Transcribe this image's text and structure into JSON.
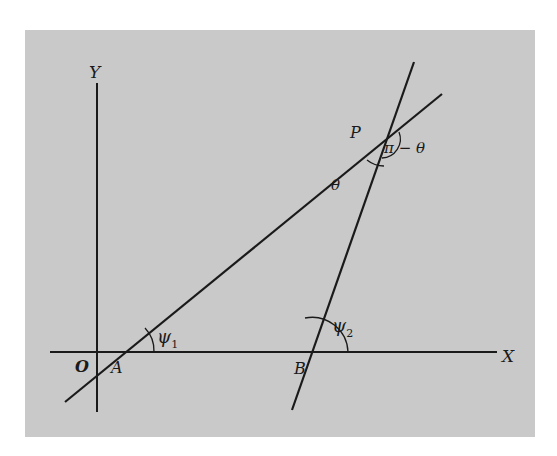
{
  "diagram": {
    "type": "geometry",
    "colors": {
      "background": "#ffffff",
      "panel": "#c9c9c9",
      "ink": "#1a1a1a"
    },
    "axes": {
      "x_label": "X",
      "y_label": "Y",
      "origin_label": "O"
    },
    "points": {
      "A": "A",
      "B": "B",
      "P": "P"
    },
    "angles": {
      "psi1": {
        "symbol": "ψ",
        "subscript": "1"
      },
      "psi2": {
        "symbol": "ψ",
        "subscript": "2"
      },
      "theta": "θ",
      "pi_minus_theta": "π − θ"
    }
  }
}
